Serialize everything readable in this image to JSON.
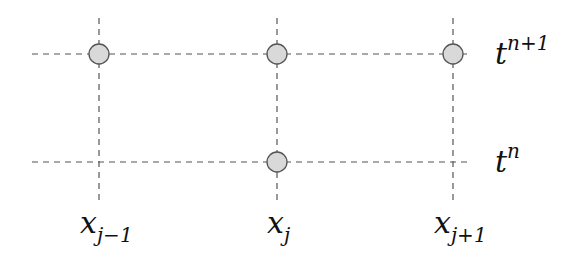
{
  "diagram": {
    "colors": {
      "grid_line": "#555555",
      "node_fill": "#d9d9d9",
      "node_stroke": "#555555",
      "text": "#111111"
    },
    "time_levels": [
      {
        "base": "t",
        "sup": "n+1",
        "y": 54
      },
      {
        "base": "t",
        "sup": "n",
        "y": 162
      }
    ],
    "space_points": [
      {
        "base": "x",
        "sub": "j−1",
        "x": 99
      },
      {
        "base": "x",
        "sub": "j",
        "x": 277
      },
      {
        "base": "x",
        "sub": "j+1",
        "x": 453
      }
    ],
    "nodes": [
      {
        "point": "x_{j-1}",
        "level": "t^{n+1}",
        "x": 99,
        "y": 54
      },
      {
        "point": "x_j",
        "level": "t^{n+1}",
        "x": 277,
        "y": 54
      },
      {
        "point": "x_{j+1}",
        "level": "t^{n+1}",
        "x": 453,
        "y": 54
      },
      {
        "point": "x_j",
        "level": "t^n",
        "x": 277,
        "y": 162
      }
    ]
  }
}
